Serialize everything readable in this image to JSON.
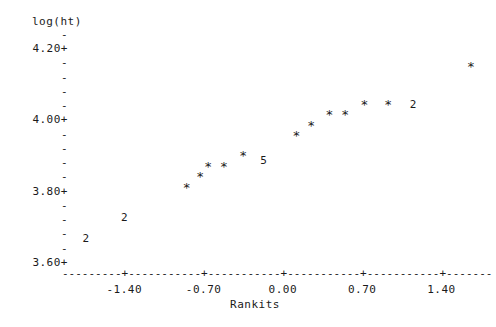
{
  "chart_data": {
    "type": "scatter",
    "title": "",
    "subtitle": "",
    "ylabel": "log(ht)",
    "xlabel": "Rankits",
    "style": "character-plot",
    "grid": false,
    "legend": null,
    "xlim": [
      -1.95,
      1.82
    ],
    "ylim": [
      3.555,
      4.265
    ],
    "x_ticks": [
      {
        "label": "-1.40",
        "value": -1.4
      },
      {
        "label": "-0.70",
        "value": -0.7
      },
      {
        "label": "0.00",
        "value": 0.0
      },
      {
        "label": "0.70",
        "value": 0.7
      },
      {
        "label": "1.40",
        "value": 1.4
      }
    ],
    "y_major_ticks": [
      {
        "label": "4.20+",
        "value": 4.2
      },
      {
        "label": "4.00+",
        "value": 4.0
      },
      {
        "label": "3.80+",
        "value": 3.8
      },
      {
        "label": "3.60+",
        "value": 3.6
      }
    ],
    "y_minor_tick_glyph": "-",
    "y_minor_tick_count_per_major": 4,
    "axis_line_glyph": "-",
    "axis_tick_glyph": "+",
    "point_glyph": "*",
    "points": [
      {
        "glyph": "2",
        "count": 2,
        "x": -1.74,
        "y": 3.635
      },
      {
        "glyph": "2",
        "count": 2,
        "x": -1.4,
        "y": 3.705
      },
      {
        "glyph": "*",
        "count": 1,
        "x": -0.85,
        "y": 3.795
      },
      {
        "glyph": "*",
        "count": 1,
        "x": -0.73,
        "y": 3.83
      },
      {
        "glyph": "*",
        "count": 1,
        "x": -0.66,
        "y": 3.865
      },
      {
        "glyph": "*",
        "count": 1,
        "x": -0.52,
        "y": 3.865
      },
      {
        "glyph": "*",
        "count": 1,
        "x": -0.35,
        "y": 3.9
      },
      {
        "glyph": "5",
        "count": 5,
        "x": -0.17,
        "y": 3.895
      },
      {
        "glyph": "*",
        "count": 1,
        "x": 0.12,
        "y": 3.965
      },
      {
        "glyph": "*",
        "count": 1,
        "x": 0.25,
        "y": 4.0
      },
      {
        "glyph": "*",
        "count": 1,
        "x": 0.41,
        "y": 4.035
      },
      {
        "glyph": "*",
        "count": 1,
        "x": 0.55,
        "y": 4.035
      },
      {
        "glyph": "*",
        "count": 1,
        "x": 0.72,
        "y": 4.07
      },
      {
        "glyph": "*",
        "count": 1,
        "x": 0.93,
        "y": 4.07
      },
      {
        "glyph": "2",
        "count": 2,
        "x": 1.15,
        "y": 4.08
      },
      {
        "glyph": "*",
        "count": 1,
        "x": 1.66,
        "y": 4.195
      }
    ]
  }
}
